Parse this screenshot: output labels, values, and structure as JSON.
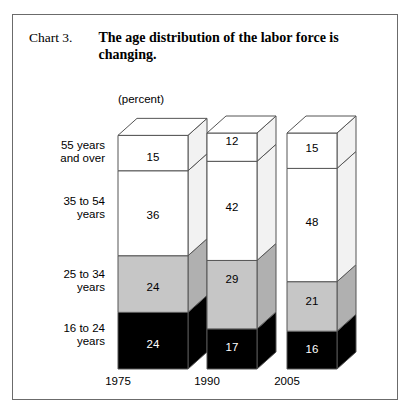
{
  "figure": {
    "number": "Chart 3.",
    "title": "The age distribution of the labor force is changing.",
    "unit": "(percent)"
  },
  "chart_data": {
    "type": "bar",
    "subtype": "stacked-column-3d",
    "title": "The age distribution of the labor force is changing.",
    "xlabel": "",
    "ylabel": "(percent)",
    "ylim": [
      0,
      100
    ],
    "grid": false,
    "legend": "none",
    "stacked_total": 100,
    "categories": [
      "1975",
      "1990",
      "2005"
    ],
    "series": [
      {
        "name": "16 to 24 years",
        "values": [
          24,
          17,
          16
        ],
        "color": "#000000",
        "text_color": "#ffffff"
      },
      {
        "name": "25 to 34 years",
        "values": [
          24,
          29,
          21
        ],
        "color": "#c6c6c6",
        "text_color": "#000000"
      },
      {
        "name": "35 to 54 years",
        "values": [
          36,
          42,
          48
        ],
        "color": "#ffffff",
        "text_color": "#000000"
      },
      {
        "name": "55 years and over",
        "values": [
          15,
          12,
          15
        ],
        "color": "#ffffff",
        "text_color": "#000000"
      }
    ]
  },
  "labels": {
    "row_55": {
      "line1": "55 years",
      "line2": "and over"
    },
    "row_35": {
      "line1": "35 to 54",
      "line2": "years"
    },
    "row_25": {
      "line1": "25 to 34",
      "line2": "years"
    },
    "row_16": {
      "line1": "16 to 24",
      "line2": "years"
    },
    "year_1975": "1975",
    "year_1990": "1990",
    "year_2005": "2005"
  },
  "values": {
    "b1975": {
      "s55": "15",
      "s35": "36",
      "s25": "24",
      "s16": "24"
    },
    "b1990": {
      "s55": "12",
      "s35": "42",
      "s25": "29",
      "s16": "17"
    },
    "b2005": {
      "s55": "15",
      "s35": "48",
      "s25": "21",
      "s16": "16"
    }
  },
  "colors": {
    "frame": "#6b6b6b",
    "outline": "#555555",
    "black_segment": "#000000",
    "gray_segment": "#c6c6c6",
    "white_segment": "#ffffff",
    "gray_side": "#b0b0b0",
    "white_side": "#f2f2f2"
  }
}
